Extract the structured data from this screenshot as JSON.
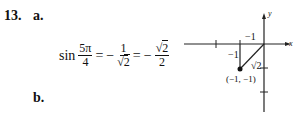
{
  "problem": {
    "number": "13.",
    "part_a_label": "a.",
    "part_b_label": "b.",
    "equation": {
      "func": "sin",
      "arg_num": "5π",
      "arg_den": "4",
      "eq1": "=",
      "neg1": "−",
      "f1_num": "1",
      "f1_den_root": "√",
      "f1_den_rad": "2",
      "eq2": "=",
      "neg2": "−",
      "f2_num_root": "√",
      "f2_num_rad": "2",
      "f2_den": "2"
    }
  },
  "graph": {
    "axis_x_label": "x",
    "axis_y_label": "y",
    "leg_horizontal": "−1",
    "leg_vertical": "−1",
    "hypotenuse": "√2",
    "point": "(−1, −1)"
  }
}
